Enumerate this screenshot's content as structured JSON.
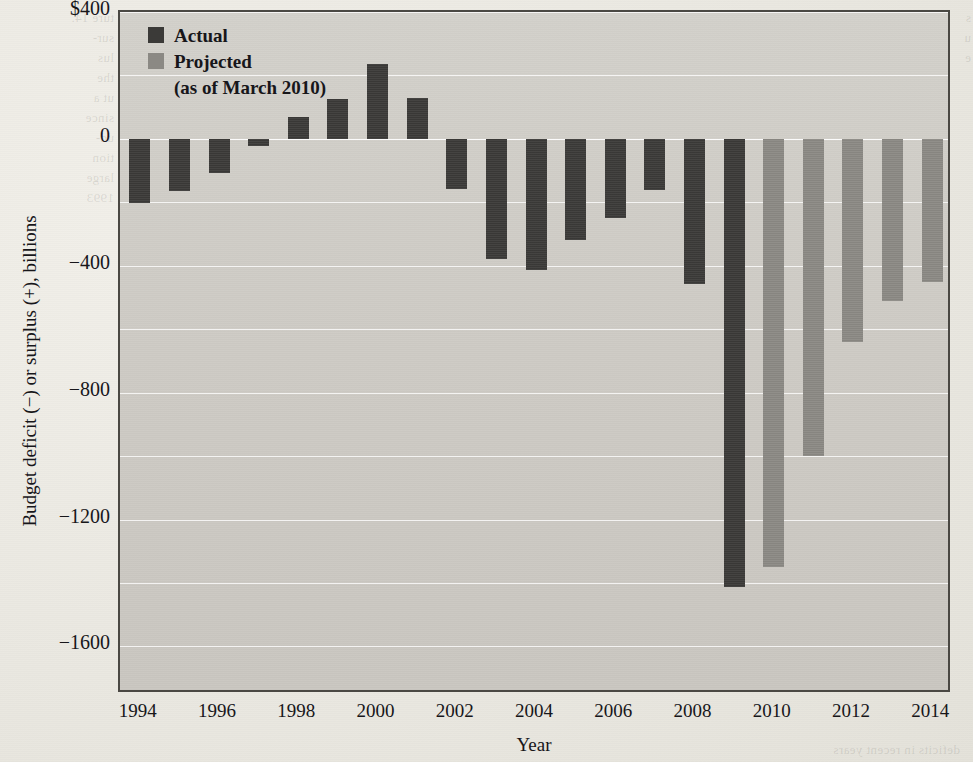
{
  "chart_data": {
    "type": "bar",
    "title": "",
    "xlabel": "Year",
    "ylabel": "Budget deficit (−) or surplus (+), billions",
    "ylim": [
      -1750,
      400
    ],
    "yticks": [
      400,
      0,
      -400,
      -800,
      -1200,
      -1600
    ],
    "ytick_labels": [
      "$400",
      "0",
      "−400",
      "−800",
      "−1200",
      "−1600"
    ],
    "grid": true,
    "grid_step": 200,
    "legend_position": "top-left",
    "categories": [
      1994,
      1995,
      1996,
      1997,
      1998,
      1999,
      2000,
      2001,
      2002,
      2003,
      2004,
      2005,
      2006,
      2007,
      2008,
      2009,
      2010,
      2011,
      2012,
      2013,
      2014
    ],
    "xtick_labels": [
      "1994",
      "1996",
      "1998",
      "2000",
      "2002",
      "2004",
      "2006",
      "2008",
      "2010",
      "2012",
      "2014"
    ],
    "xticks": [
      1994,
      1996,
      1998,
      2000,
      2002,
      2004,
      2006,
      2008,
      2010,
      2012,
      2014
    ],
    "series": [
      {
        "name": "Actual",
        "color": "#3b3a38",
        "points": [
          {
            "x": 1994,
            "y": -203
          },
          {
            "x": 1995,
            "y": -164
          },
          {
            "x": 1996,
            "y": -107
          },
          {
            "x": 1997,
            "y": -22
          },
          {
            "x": 1998,
            "y": 69
          },
          {
            "x": 1999,
            "y": 126
          },
          {
            "x": 2000,
            "y": 236
          },
          {
            "x": 2001,
            "y": 128
          },
          {
            "x": 2002,
            "y": -158
          },
          {
            "x": 2003,
            "y": -378
          },
          {
            "x": 2004,
            "y": -413
          },
          {
            "x": 2005,
            "y": -318
          },
          {
            "x": 2006,
            "y": -248
          },
          {
            "x": 2007,
            "y": -161
          },
          {
            "x": 2008,
            "y": -459
          },
          {
            "x": 2009,
            "y": -1413
          }
        ]
      },
      {
        "name": "Projected (as of March 2010)",
        "color": "#8b8984",
        "points": [
          {
            "x": 2010,
            "y": -1350
          },
          {
            "x": 2011,
            "y": -1000
          },
          {
            "x": 2012,
            "y": -640
          },
          {
            "x": 2013,
            "y": -510
          },
          {
            "x": 2014,
            "y": -450
          }
        ]
      }
    ]
  },
  "legend": {
    "actual_label": "Actual",
    "projected_label": "Projected",
    "projected_sub": "(as of March 2010)",
    "actual_color": "#3b3a38",
    "projected_color": "#8b8984"
  },
  "paper": {
    "ghost_left": "ture 14.\nsur-\nlus\nthe\nut a\nsince\nud-\ntion\nlarge\n1993",
    "ghost_right": "s\nu\ne",
    "ghost_bottom": "deficits in recent years"
  }
}
